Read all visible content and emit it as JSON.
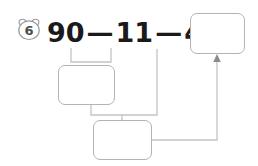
{
  "page": {
    "background_color": "#ffffff",
    "width": 258,
    "height": 166
  },
  "problem": {
    "badge_icon": "bear-head-icon",
    "number": "6",
    "badge_color": "#808080"
  },
  "equation": {
    "terms": [
      "90",
      "11",
      "46"
    ],
    "operators": [
      "—",
      "—"
    ],
    "equals": "=",
    "full_text": "90 — 11 — 46 =",
    "text_color": "#1a1a1a"
  },
  "boxes": [
    {
      "id": "result",
      "label": "answer-box-result",
      "value": "",
      "placeholder": ""
    },
    {
      "id": "step1",
      "label": "answer-box-step-1",
      "value": "",
      "placeholder": ""
    },
    {
      "id": "step2",
      "label": "answer-box-step-2",
      "value": "",
      "placeholder": ""
    }
  ],
  "connectors": {
    "line_color": "#b3b3b3",
    "arrow_color": "#808080",
    "bracket_label": "bracket-under-90-minus-11",
    "arrow_label": "arrow-to-result-box"
  }
}
